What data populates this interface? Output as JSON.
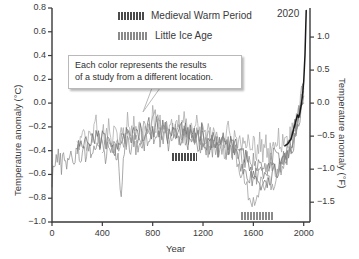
{
  "chart_data": {
    "type": "line",
    "title": "",
    "xlabel": "Year",
    "ylabel": "Temperature anomaly (°C)",
    "ylabel_right": "Temperature anomaly (°F)",
    "xlim": [
      0,
      2050
    ],
    "ylim": [
      -1.0,
      0.8
    ],
    "ylim_right": [
      -1.8,
      1.44
    ],
    "grid": false,
    "legend_position": "top-center",
    "xticks": [
      0,
      400,
      800,
      1200,
      1600,
      2000
    ],
    "xticklabels": [
      "0",
      "400",
      "800",
      "1200",
      "1600",
      "2000"
    ],
    "yticks": [
      0.8,
      0.6,
      0.4,
      0.2,
      0.0,
      -0.2,
      -0.4,
      -0.6,
      -0.8,
      -1.0
    ],
    "yticklabels": [
      "0.8",
      "0.6",
      "0.4",
      "0.2",
      "0.0",
      "-0.2",
      "-0.4",
      "-0.6",
      "-0.8",
      "-1.0"
    ],
    "yticks_right": [
      1.0,
      0.5,
      0.0,
      -0.5,
      -1.0,
      -1.5
    ],
    "yticklabels_right": [
      "1.0",
      "0.5",
      "0.0",
      "-0.5",
      "-1.0",
      "-1.5"
    ],
    "annotations": [
      {
        "name": "callout",
        "text_line1": "Each color represents the results",
        "text_line2": "of a study from a different location.",
        "points_to_year": 800
      },
      {
        "name": "year-2020-label",
        "text": "2020",
        "year": 2000,
        "value": 0.78
      }
    ],
    "era_bars": [
      {
        "label": "Medieval Warm Period",
        "x_start": 950,
        "x_end": 1150,
        "y": -0.45,
        "color": "#4a4a4a"
      },
      {
        "label": "Little Ice Age",
        "x_start": 1500,
        "x_end": 1760,
        "y": -0.95,
        "color": "#8a8a8a"
      }
    ],
    "series": [
      {
        "name": "study-1",
        "color": "#8e8e8e",
        "x": [
          0,
          25,
          50,
          75,
          100,
          125,
          150,
          175,
          200,
          225,
          250,
          275,
          300,
          325,
          350,
          375,
          400,
          425,
          450,
          475,
          500,
          525,
          550,
          575,
          600,
          625,
          650,
          675,
          700,
          725,
          750,
          775,
          800,
          825,
          850,
          875,
          900,
          925,
          950,
          975,
          1000,
          1025,
          1050,
          1075,
          1100,
          1125,
          1150,
          1175,
          1200,
          1225,
          1250,
          1275,
          1300,
          1325,
          1350,
          1375,
          1400,
          1425,
          1450,
          1475,
          1500,
          1525,
          1550,
          1575,
          1600,
          1625,
          1650,
          1675,
          1700,
          1725,
          1750,
          1775,
          1800,
          1825,
          1850,
          1875,
          1900,
          1925,
          1950,
          1975,
          2000
        ],
        "y": [
          -0.62,
          -0.48,
          -0.46,
          -0.52,
          -0.44,
          -0.5,
          -0.42,
          -0.47,
          -0.4,
          -0.45,
          -0.38,
          -0.43,
          -0.36,
          -0.42,
          -0.34,
          -0.4,
          -0.35,
          -0.44,
          -0.33,
          -0.41,
          -0.36,
          -0.46,
          -0.74,
          -0.4,
          -0.34,
          -0.42,
          -0.3,
          -0.38,
          -0.28,
          -0.36,
          -0.26,
          -0.34,
          -0.24,
          -0.33,
          -0.26,
          -0.35,
          -0.24,
          -0.32,
          -0.22,
          -0.3,
          -0.2,
          -0.28,
          -0.22,
          -0.3,
          -0.24,
          -0.32,
          -0.26,
          -0.34,
          -0.28,
          -0.36,
          -0.3,
          -0.38,
          -0.32,
          -0.4,
          -0.34,
          -0.42,
          -0.36,
          -0.44,
          -0.38,
          -0.46,
          -0.42,
          -0.52,
          -0.46,
          -0.56,
          -0.5,
          -0.6,
          -0.48,
          -0.58,
          -0.5,
          -0.6,
          -0.52,
          -0.58,
          -0.5,
          -0.54,
          -0.46,
          -0.48,
          -0.4,
          -0.3,
          -0.16,
          0.0,
          0.12
        ]
      },
      {
        "name": "study-2",
        "color": "#a8a8a8",
        "x": [
          200,
          225,
          250,
          275,
          300,
          325,
          350,
          375,
          400,
          425,
          450,
          475,
          500,
          525,
          550,
          575,
          600,
          625,
          650,
          675,
          700,
          725,
          750,
          775,
          800,
          825,
          850,
          875,
          900,
          925,
          950,
          975,
          1000,
          1025,
          1050,
          1075,
          1100,
          1125,
          1150,
          1175,
          1200,
          1225,
          1250,
          1275,
          1300,
          1325,
          1350,
          1375,
          1400,
          1425,
          1450,
          1475,
          1500,
          1525,
          1550,
          1575,
          1600,
          1625,
          1650,
          1675,
          1700,
          1725,
          1750,
          1775,
          1800,
          1825,
          1850,
          1875,
          1900,
          1925,
          1950,
          1975,
          2000
        ],
        "y": [
          -0.28,
          -0.36,
          -0.22,
          -0.32,
          -0.2,
          -0.3,
          -0.18,
          -0.3,
          -0.22,
          -0.34,
          -0.2,
          -0.32,
          -0.24,
          -0.36,
          -0.2,
          -0.3,
          -0.16,
          -0.28,
          -0.14,
          -0.26,
          -0.18,
          -0.3,
          -0.16,
          -0.28,
          -0.06,
          -0.2,
          -0.14,
          -0.26,
          -0.16,
          -0.28,
          -0.14,
          -0.24,
          -0.12,
          -0.22,
          -0.14,
          -0.24,
          -0.16,
          -0.26,
          -0.18,
          -0.28,
          -0.2,
          -0.3,
          -0.22,
          -0.32,
          -0.2,
          -0.3,
          -0.24,
          -0.34,
          -0.22,
          -0.32,
          -0.26,
          -0.36,
          -0.28,
          -0.4,
          -0.3,
          -0.42,
          -0.32,
          -0.44,
          -0.3,
          -0.42,
          -0.34,
          -0.44,
          -0.3,
          -0.4,
          -0.28,
          -0.36,
          -0.26,
          -0.32,
          -0.24,
          -0.2,
          -0.1,
          0.02,
          0.14
        ]
      },
      {
        "name": "study-3",
        "color": "#6e6e6e",
        "x": [
          200,
          230,
          260,
          290,
          320,
          350,
          380,
          410,
          440,
          470,
          500,
          530,
          560,
          590,
          620,
          650,
          680,
          710,
          740,
          770,
          800,
          830,
          860,
          890,
          920,
          950,
          980,
          1010,
          1040,
          1070,
          1100,
          1130,
          1160,
          1190,
          1220,
          1250,
          1280,
          1310,
          1340,
          1370,
          1400,
          1430,
          1460,
          1490,
          1520,
          1550,
          1580,
          1610,
          1640,
          1670,
          1700,
          1730,
          1760,
          1790,
          1820,
          1850,
          1880,
          1910,
          1940,
          1970,
          2000
        ],
        "y": [
          -0.38,
          -0.3,
          -0.36,
          -0.28,
          -0.34,
          -0.26,
          -0.34,
          -0.28,
          -0.36,
          -0.3,
          -0.38,
          -0.3,
          -0.36,
          -0.26,
          -0.32,
          -0.24,
          -0.3,
          -0.22,
          -0.28,
          -0.2,
          -0.26,
          -0.18,
          -0.26,
          -0.2,
          -0.28,
          -0.2,
          -0.26,
          -0.18,
          -0.24,
          -0.2,
          -0.26,
          -0.22,
          -0.28,
          -0.24,
          -0.3,
          -0.26,
          -0.32,
          -0.28,
          -0.34,
          -0.3,
          -0.36,
          -0.32,
          -0.38,
          -0.34,
          -0.42,
          -0.5,
          -0.58,
          -0.66,
          -0.72,
          -0.68,
          -0.62,
          -0.66,
          -0.6,
          -0.56,
          -0.5,
          -0.44,
          -0.38,
          -0.3,
          -0.18,
          -0.04,
          0.06
        ]
      },
      {
        "name": "study-4",
        "color": "#9a9a9a",
        "x": [
          400,
          430,
          460,
          490,
          520,
          550,
          580,
          610,
          640,
          670,
          700,
          730,
          760,
          790,
          820,
          850,
          880,
          910,
          940,
          970,
          1000,
          1030,
          1060,
          1090,
          1120,
          1150,
          1180,
          1210,
          1240,
          1270,
          1300,
          1330,
          1360,
          1390,
          1420,
          1450,
          1480,
          1510,
          1540,
          1570,
          1600,
          1630,
          1660,
          1690,
          1720,
          1750,
          1780,
          1810,
          1840,
          1870,
          1900,
          1930,
          1960,
          1990,
          2000
        ],
        "y": [
          -0.42,
          -0.34,
          -0.4,
          -0.32,
          -0.38,
          -0.3,
          -0.36,
          -0.26,
          -0.32,
          -0.24,
          -0.3,
          -0.22,
          -0.3,
          -0.24,
          -0.02,
          -0.18,
          -0.26,
          -0.2,
          -0.28,
          -0.22,
          -0.3,
          -0.24,
          -0.32,
          -0.26,
          -0.34,
          -0.28,
          -0.36,
          -0.3,
          -0.38,
          -0.32,
          -0.4,
          -0.34,
          -0.42,
          -0.36,
          -0.44,
          -0.4,
          -0.5,
          -0.6,
          -0.7,
          -0.78,
          -0.84,
          -0.76,
          -0.7,
          -0.74,
          -0.66,
          -0.7,
          -0.62,
          -0.56,
          -0.5,
          -0.42,
          -0.34,
          -0.24,
          -0.1,
          0.04,
          0.1
        ]
      },
      {
        "name": "study-5",
        "color": "#7d7d7d",
        "x": [
          1000,
          1040,
          1080,
          1120,
          1160,
          1200,
          1240,
          1280,
          1320,
          1360,
          1400,
          1440,
          1480,
          1520,
          1560,
          1600,
          1640,
          1680,
          1720,
          1760,
          1800,
          1840,
          1880,
          1920,
          1960,
          2000
        ],
        "y": [
          -0.3,
          -0.26,
          -0.32,
          -0.28,
          -0.34,
          -0.3,
          -0.36,
          -0.32,
          -0.38,
          -0.34,
          -0.4,
          -0.36,
          -0.44,
          -0.54,
          -0.64,
          -0.62,
          -0.56,
          -0.58,
          -0.52,
          -0.46,
          -0.44,
          -0.44,
          -0.42,
          -0.36,
          -0.22,
          0.0
        ]
      },
      {
        "name": "study-6-instrumental",
        "color": "#1a1a1a",
        "x": [
          1850,
          1875,
          1900,
          1920,
          1940,
          1950,
          1960,
          1970,
          1980,
          1990,
          2000,
          2010,
          2020
        ],
        "y": [
          -0.36,
          -0.34,
          -0.3,
          -0.22,
          -0.14,
          -0.1,
          -0.12,
          -0.08,
          -0.02,
          0.06,
          0.18,
          0.4,
          0.78
        ]
      }
    ]
  },
  "legend": {
    "items": [
      {
        "label": "Medieval Warm Period",
        "swatch": "#4a4a4a"
      },
      {
        "label": "Little Ice Age",
        "swatch": "#8a8a8a"
      }
    ]
  }
}
